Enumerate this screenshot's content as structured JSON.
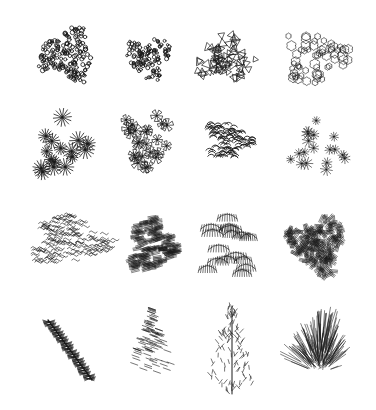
{
  "sheet": {
    "title": "",
    "background": "#ffffff",
    "ink": "#1a1a1a",
    "rows": 4,
    "cols": 4
  },
  "symbols": [
    {
      "row": 0,
      "col": 0,
      "name": "pebble-cluster",
      "style": "circles",
      "cx": 68,
      "cy": 55,
      "rx": 32,
      "ry": 30,
      "count": 170,
      "size": 1.9
    },
    {
      "row": 0,
      "col": 1,
      "name": "dense-dot-cluster",
      "style": "circles",
      "cx": 148,
      "cy": 57,
      "rx": 27,
      "ry": 24,
      "count": 120,
      "size": 1.7
    },
    {
      "row": 0,
      "col": 2,
      "name": "triangle-leaf-cluster",
      "style": "triangles",
      "cx": 226,
      "cy": 57,
      "rx": 32,
      "ry": 27,
      "count": 70,
      "size": 4.2
    },
    {
      "row": 0,
      "col": 3,
      "name": "cloud-outline-shrub",
      "style": "cloud",
      "cx": 316,
      "cy": 57,
      "rx": 36,
      "ry": 30,
      "count": 60,
      "size": 2.2
    },
    {
      "row": 1,
      "col": 0,
      "name": "starburst-cluster",
      "style": "stars",
      "cx": 63,
      "cy": 145,
      "rx": 30,
      "ry": 38,
      "count": 16,
      "size": 7
    },
    {
      "row": 1,
      "col": 1,
      "name": "petal-flower-cluster",
      "style": "petals",
      "cx": 148,
      "cy": 143,
      "rx": 27,
      "ry": 36,
      "count": 24,
      "size": 6
    },
    {
      "row": 1,
      "col": 2,
      "name": "curled-stroke-mound",
      "style": "curls",
      "cx": 228,
      "cy": 141,
      "rx": 26,
      "ry": 23,
      "count": 120,
      "size": 3.5
    },
    {
      "row": 1,
      "col": 3,
      "name": "scattered-star-cluster",
      "style": "smallstars",
      "cx": 320,
      "cy": 148,
      "rx": 32,
      "ry": 32,
      "count": 18,
      "size": 5
    },
    {
      "row": 2,
      "col": 0,
      "name": "wavy-leaf-spread",
      "style": "waves",
      "cx": 70,
      "cy": 240,
      "rx": 45,
      "ry": 30,
      "count": 180,
      "size": 4
    },
    {
      "row": 2,
      "col": 1,
      "name": "hatched-leaf-mass",
      "style": "hatch",
      "cx": 152,
      "cy": 244,
      "rx": 27,
      "ry": 32,
      "count": 150,
      "size": 4
    },
    {
      "row": 2,
      "col": 2,
      "name": "tiered-frond-shrub",
      "style": "fronds",
      "cx": 234,
      "cy": 245,
      "rx": 36,
      "ry": 38,
      "count": 16,
      "size": 8
    },
    {
      "row": 2,
      "col": 3,
      "name": "tangled-hatch-mass",
      "style": "hatch2",
      "cx": 318,
      "cy": 245,
      "rx": 32,
      "ry": 32,
      "count": 190,
      "size": 4
    },
    {
      "row": 3,
      "col": 0,
      "name": "diagonal-branch-fern",
      "style": "branch",
      "cx": 68,
      "cy": 350,
      "rx": 30,
      "ry": 30,
      "count": 22,
      "size": 6
    },
    {
      "row": 3,
      "col": 1,
      "name": "conifer-triangle",
      "style": "conifer",
      "cx": 152,
      "cy": 340,
      "rx": 24,
      "ry": 32,
      "count": 90,
      "size": 3.5
    },
    {
      "row": 3,
      "col": 2,
      "name": "upright-frond-spray",
      "style": "spray",
      "cx": 232,
      "cy": 350,
      "rx": 26,
      "ry": 44,
      "count": 110,
      "size": 4
    },
    {
      "row": 3,
      "col": 3,
      "name": "fan-grass-mound",
      "style": "fan",
      "cx": 320,
      "cy": 343,
      "rx": 38,
      "ry": 30,
      "count": 140,
      "size": 5
    }
  ]
}
